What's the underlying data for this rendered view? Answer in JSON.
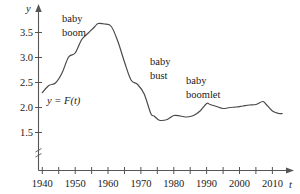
{
  "chart_data": {
    "type": "line",
    "title": "",
    "subtitle": "",
    "xlabel": "t",
    "ylabel": "y",
    "xlim": [
      1938,
      2016
    ],
    "ylim": [
      1.4,
      3.78
    ],
    "grid": false,
    "legend": "none",
    "y_axis_break": true,
    "y_ticks": [
      1.5,
      2.0,
      2.5,
      3.0,
      3.5
    ],
    "y_tick_labels": [
      "1.5",
      "2.0",
      "2.5",
      "3.0",
      "3.5"
    ],
    "x_ticks": [
      1940,
      1945,
      1950,
      1955,
      1960,
      1965,
      1970,
      1975,
      1980,
      1985,
      1990,
      1995,
      2000,
      2005,
      2010,
      2015
    ],
    "x_tick_labels": [
      "1940",
      "",
      "1950",
      "",
      "1960",
      "",
      "1970",
      "",
      "1980",
      "",
      "1990",
      "",
      "2000",
      "",
      "2010",
      ""
    ],
    "series": [
      {
        "name": "y = F(t)",
        "x": [
          1940,
          1942,
          1944,
          1946,
          1948,
          1950,
          1952,
          1954,
          1956,
          1957,
          1959,
          1961,
          1963,
          1965,
          1967,
          1969,
          1971,
          1973,
          1974,
          1975,
          1976,
          1978,
          1980,
          1982,
          1984,
          1986,
          1988,
          1990,
          1991,
          1993,
          1995,
          1997,
          1999,
          2001,
          2003,
          2005,
          2007,
          2008,
          2010,
          2012,
          2013
        ],
        "values": [
          2.3,
          2.44,
          2.49,
          2.69,
          3.01,
          3.09,
          3.36,
          3.49,
          3.62,
          3.68,
          3.67,
          3.62,
          3.32,
          2.91,
          2.55,
          2.46,
          2.27,
          1.88,
          1.83,
          1.77,
          1.74,
          1.76,
          1.84,
          1.83,
          1.81,
          1.84,
          1.93,
          2.08,
          2.06,
          2.02,
          1.98,
          2.0,
          2.01,
          2.03,
          2.05,
          2.06,
          2.12,
          2.07,
          1.93,
          1.88,
          1.88
        ]
      }
    ],
    "annotations": [
      {
        "name": "baby-boom",
        "text_lines": [
          "baby",
          "boom"
        ],
        "x": 1954,
        "y": 3.95
      },
      {
        "name": "baby-bust",
        "text_lines": [
          "baby",
          "bust"
        ],
        "x": 1973,
        "y": 3.03
      },
      {
        "name": "baby-boomlet",
        "text_lines": [
          "baby",
          "boomlet"
        ],
        "x": 1987,
        "y": 2.62
      },
      {
        "name": "function-label",
        "text_lines": [
          "y = F(t)"
        ],
        "x": 1943,
        "y": 2.3
      }
    ]
  },
  "axes": {
    "y_axis_name": "y",
    "x_axis_name": "t"
  },
  "labels": {
    "y_3_5": "3.5",
    "y_3_0": "3.0",
    "y_2_5": "2.5",
    "y_2_0": "2.0",
    "y_1_5": "1.5",
    "x_1940": "1940",
    "x_1950": "1950",
    "x_1960": "1960",
    "x_1970": "1970",
    "x_1980": "1980",
    "x_1990": "1990",
    "x_2000": "2000",
    "x_2010": "2010",
    "baby_boom_line1": "baby",
    "baby_boom_line2": "boom",
    "baby_bust_line1": "baby",
    "baby_bust_line2": "bust",
    "baby_boomlet_line1": "baby",
    "baby_boomlet_line2": "boomlet",
    "function_label": "y = F(t)"
  },
  "colors": {
    "curve": "#4a4a4a",
    "axis": "#555555",
    "text": "#1a1a1a",
    "background": "#ffffff"
  }
}
